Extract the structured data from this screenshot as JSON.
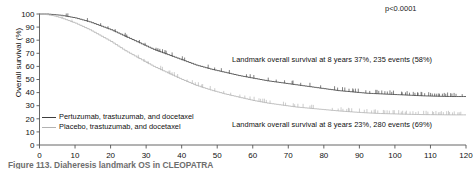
{
  "figure": {
    "pvalue": "p<0.0001",
    "caption": "Figure 113.   Diaheresis landmark OS in CLEOPATRA",
    "annotations": {
      "top": "Landmark overall survival at 8 years 37%, 235 events (58%)",
      "bottom": "Landmark overall survival at 8 years 23%, 280 events (69%)"
    },
    "legend": [
      {
        "label": "Pertuzumab, trastuzumab, and docetaxel",
        "color": "#3d3d3d"
      },
      {
        "label": "Placebo, trastuzumab, and docetaxel",
        "color": "#b2b2b2"
      }
    ]
  },
  "chart_data": {
    "type": "line",
    "title": "",
    "xlabel": "",
    "ylabel": "Overall survival (%)",
    "xlim": [
      0,
      120
    ],
    "ylim": [
      0,
      100
    ],
    "xticks": [
      0,
      10,
      20,
      30,
      40,
      50,
      60,
      70,
      80,
      90,
      100,
      110,
      120
    ],
    "yticks": [
      0,
      10,
      20,
      30,
      40,
      50,
      60,
      70,
      80,
      90,
      100
    ],
    "grid": false,
    "legend_position": "lower-left",
    "annotations": [
      {
        "text": "p<0.0001",
        "x": 105,
        "y": 97
      },
      {
        "text": "Landmark overall survival at 8 years 37%, 235 events (58%)",
        "x": 55,
        "y": 68
      },
      {
        "text": "Landmark overall survival at 8 years 23%, 280 events (69%)",
        "x": 55,
        "y": 18
      }
    ],
    "series": [
      {
        "name": "Pertuzumab, trastuzumab, and docetaxel",
        "color": "#3d3d3d",
        "landmark_8yr_survival_pct": 37,
        "events": 235,
        "events_pct": 58,
        "x": [
          0,
          2,
          4,
          6,
          8,
          10,
          12,
          14,
          16,
          18,
          20,
          22,
          24,
          26,
          28,
          30,
          32,
          34,
          36,
          38,
          40,
          44,
          48,
          52,
          56,
          60,
          64,
          68,
          72,
          76,
          80,
          84,
          88,
          92,
          96,
          100,
          104,
          108,
          112,
          116,
          120
        ],
        "y": [
          100,
          100,
          99.5,
          99,
          98,
          97,
          95.5,
          94,
          92,
          90,
          88,
          85.5,
          83,
          80.5,
          78,
          75.5,
          73,
          71,
          69,
          67,
          65,
          61,
          58,
          55.5,
          53,
          51,
          49,
          47.5,
          46,
          44.5,
          43,
          41.5,
          40.5,
          39.5,
          39,
          38.5,
          38,
          37.5,
          37.2,
          37,
          37
        ]
      },
      {
        "name": "Placebo, trastuzumab, and docetaxel",
        "color": "#b2b2b2",
        "landmark_8yr_survival_pct": 23,
        "events": 280,
        "events_pct": 69,
        "x": [
          0,
          2,
          4,
          6,
          8,
          10,
          12,
          14,
          16,
          18,
          20,
          22,
          24,
          26,
          28,
          30,
          32,
          34,
          36,
          38,
          40,
          44,
          48,
          52,
          56,
          60,
          64,
          68,
          72,
          76,
          80,
          84,
          88,
          92,
          96,
          100,
          104,
          108,
          112,
          116,
          120
        ],
        "y": [
          100,
          99.5,
          98.5,
          97,
          95,
          93,
          90.5,
          88,
          85,
          82,
          79,
          75.5,
          72,
          69,
          66,
          63,
          60,
          57.5,
          55,
          52.5,
          50,
          45.5,
          42,
          39,
          36.5,
          34,
          32,
          30.5,
          29,
          28,
          27,
          26,
          25.2,
          24.5,
          24,
          23.7,
          23.4,
          23.2,
          23.1,
          23,
          23
        ]
      }
    ]
  }
}
